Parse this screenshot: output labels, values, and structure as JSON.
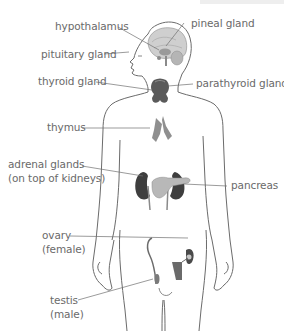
{
  "diagram": {
    "colors": {
      "outline": "#6b6b6b",
      "leader_line": "#707070",
      "label_text": "#6a6a6a",
      "brain": "#cfcfcf",
      "gland_dark": "#4a4a4a",
      "gland_mid": "#8f8f8f",
      "pancreas": "#b8b8b8"
    },
    "labels": [
      {
        "id": "hypothalamus",
        "text": "hypothalamus",
        "side": "left"
      },
      {
        "id": "pineal",
        "text": "pineal gland",
        "side": "right"
      },
      {
        "id": "pituitary",
        "text": "pituitary gland",
        "side": "left"
      },
      {
        "id": "thyroid",
        "text": "thyroid gland",
        "side": "left"
      },
      {
        "id": "parathyroid",
        "text": "parathyroid glands",
        "side": "right"
      },
      {
        "id": "thymus",
        "text": "thymus",
        "side": "left"
      },
      {
        "id": "adrenal_1",
        "text": "adrenal glands",
        "side": "left"
      },
      {
        "id": "adrenal_2",
        "text": "(on top of kidneys)",
        "side": "left"
      },
      {
        "id": "pancreas",
        "text": "pancreas",
        "side": "right"
      },
      {
        "id": "ovary_1",
        "text": "ovary",
        "side": "left"
      },
      {
        "id": "ovary_2",
        "text": "(female)",
        "side": "left"
      },
      {
        "id": "testis_1",
        "text": "testis",
        "side": "left"
      },
      {
        "id": "testis_2",
        "text": "(male)",
        "side": "left"
      }
    ]
  }
}
